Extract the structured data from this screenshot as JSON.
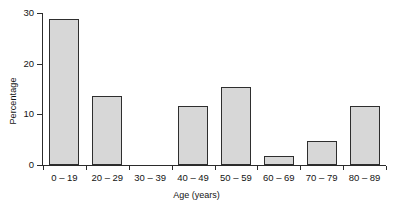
{
  "chart_data": {
    "type": "bar",
    "title": "",
    "xlabel": "Age (years)",
    "ylabel": "Percentage",
    "categories": [
      "0 – 19",
      "20 – 29",
      "30 – 39",
      "40 – 49",
      "50 – 59",
      "60 – 69",
      "70 – 79",
      "80 – 89"
    ],
    "values": [
      28.8,
      13.7,
      0,
      11.6,
      15.4,
      1.8,
      4.7,
      11.6
    ],
    "ylim": [
      0,
      30
    ],
    "yticks": [
      0,
      10,
      20,
      30
    ],
    "ytick_labels": [
      "0",
      "10",
      "20",
      "30"
    ],
    "grid": false,
    "legend": null,
    "bar_fill_color": "#d7d7d7",
    "bar_edge_color": "#2e2e2e",
    "axis_color": "#2b2b2b",
    "background_color": "#ffffff"
  }
}
